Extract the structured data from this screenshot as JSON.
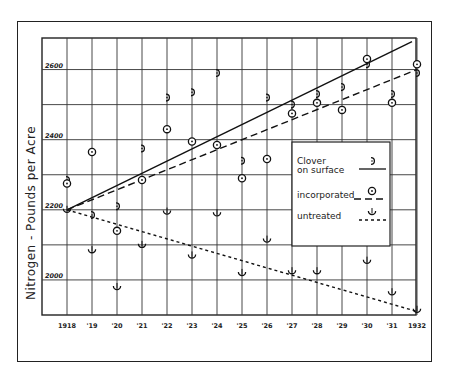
{
  "chart_data": {
    "type": "scatter",
    "title": "",
    "xlabel": "",
    "ylabel": "Nitrogen - Pounds per Acre",
    "x_tick_labels": [
      "1918",
      "'19",
      "'20",
      "'21",
      "'22",
      "'23",
      "'24",
      "'25",
      "'26",
      "'27",
      "'28",
      "'29",
      "'30",
      "'31",
      "1932"
    ],
    "x": [
      1918,
      1919,
      1920,
      1921,
      1922,
      1923,
      1924,
      1925,
      1926,
      1927,
      1928,
      1929,
      1930,
      1931,
      1932
    ],
    "y_tick_labels": [
      "2000",
      "2200",
      "2400",
      "2600"
    ],
    "ylim": [
      1900,
      2700
    ],
    "grid": true,
    "legend_position": "inside right, middle",
    "series": [
      {
        "name": "Clover on surface",
        "marker": "half-circle-right",
        "line": "solid",
        "values": [
          2285,
          2185,
          2210,
          2375,
          2520,
          2535,
          2590,
          2340,
          2520,
          2500,
          2530,
          2550,
          2615,
          2530,
          2590
        ],
        "trend": {
          "from": [
            1918,
            2200
          ],
          "to": [
            1931.8,
            2680
          ]
        }
      },
      {
        "name": "incorporated",
        "marker": "circle-dot",
        "line": "dashed",
        "values": [
          2275,
          2365,
          2140,
          2285,
          2430,
          2395,
          2385,
          2290,
          2345,
          2475,
          2505,
          2485,
          2630,
          2505,
          2615
        ],
        "trend": {
          "from": [
            1918,
            2200
          ],
          "to": [
            1932,
            2600
          ]
        }
      },
      {
        "name": "untreated",
        "marker": "cup",
        "line": "dotted",
        "values": [
          2200,
          2085,
          1980,
          2100,
          2195,
          2070,
          2190,
          2020,
          2115,
          2025,
          2025,
          null,
          2055,
          1965,
          1915
        ],
        "trend": {
          "from": [
            1918,
            2200
          ],
          "to": [
            1932,
            1910
          ]
        }
      }
    ]
  },
  "legend": {
    "items": [
      {
        "label_line1": "Clover",
        "label_line2": "on surface",
        "style": "solid"
      },
      {
        "label_line1": "incorporated",
        "label_line2": "",
        "style": "dashed"
      },
      {
        "label_line1": "untreated",
        "label_line2": "",
        "style": "dotted"
      }
    ]
  }
}
